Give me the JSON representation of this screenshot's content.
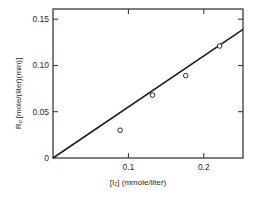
{
  "chart_data": {
    "type": "scatter",
    "title": "",
    "xlabel": "[I₂] (mmole/liter)",
    "ylabel": "Rₚ [mole/(liter)(min)]",
    "xlim": [
      0,
      0.252
    ],
    "ylim": [
      0,
      0.161
    ],
    "xticks": [
      0.1,
      0.2
    ],
    "xtick_labels": [
      "0.1",
      "0.2"
    ],
    "yticks": [
      0,
      0.05,
      0.1,
      0.15
    ],
    "ytick_labels": [
      "0",
      "0.05",
      "0.10",
      "0.15"
    ],
    "grid": false,
    "legend": null,
    "series": [
      {
        "name": "measured",
        "marker": "open-circle",
        "x": [
          0.089,
          0.132,
          0.176,
          0.221
        ],
        "y": [
          0.03,
          0.068,
          0.089,
          0.121
        ]
      },
      {
        "name": "fit",
        "style": "line",
        "x": [
          0,
          0.252
        ],
        "y": [
          0,
          0.139
        ]
      }
    ]
  }
}
